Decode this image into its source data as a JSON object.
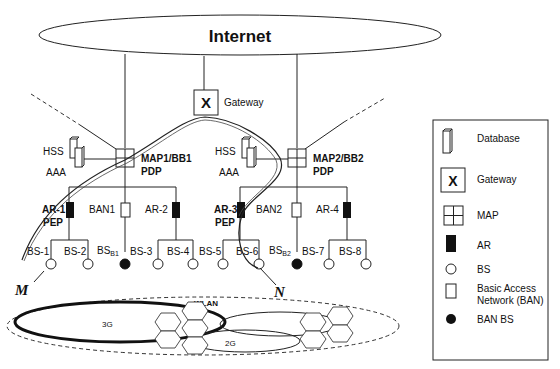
{
  "diagram": {
    "cloud_label": "Internet",
    "gateway": {
      "glyph": "X",
      "label": "Gateway"
    },
    "domain1": {
      "map_label": "MAP1/BB1",
      "pdp_label": "PDP",
      "hss_label": "HSS",
      "aaa_label": "AAA",
      "ar_pep": {
        "name": "AR-1",
        "role": "PEP"
      },
      "ban": "BAN1",
      "ar_plain": "AR-2",
      "bs": [
        "BS-1",
        "BS-2",
        "BS-3",
        "BS-4"
      ],
      "ban_bs": {
        "base": "BS",
        "sub": "B1"
      }
    },
    "domain2": {
      "map_label": "MAP2/BB2",
      "pdp_label": "PDP",
      "hss_label": "HSS",
      "aaa_label": "AAA",
      "ar_pep": {
        "name": "AR-3",
        "role": "PEP"
      },
      "ban": "BAN2",
      "ar_plain": "AR-4",
      "bs": [
        "BS-5",
        "BS-6",
        "BS-7",
        "BS-8"
      ],
      "ban_bs": {
        "base": "BS",
        "sub": "B2"
      }
    },
    "trajectory": {
      "start": "M",
      "end": "N"
    },
    "coverage": {
      "wlan": "WLAN",
      "g3": "3G",
      "g2": "2G"
    }
  },
  "legend": {
    "items": [
      {
        "icon": "database-icon",
        "label": "Database"
      },
      {
        "icon": "gateway-icon",
        "glyph": "X",
        "label": "Gateway"
      },
      {
        "icon": "map-icon",
        "label": "MAP"
      },
      {
        "icon": "ar-icon",
        "label": "AR"
      },
      {
        "icon": "bs-icon",
        "label": "BS"
      },
      {
        "icon": "ban-icon",
        "label": "Basic Access",
        "label2": "Network (BAN)"
      },
      {
        "icon": "ban-bs-icon",
        "label": "BAN BS"
      }
    ]
  }
}
